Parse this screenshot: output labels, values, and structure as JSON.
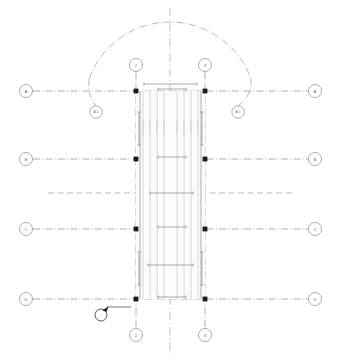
{
  "drawing": {
    "title": "Structural Grid / Stair Shaft Plan",
    "background_color": "#ffffff",
    "line_color": "#8a8a8a",
    "node_color": "#1a1a1a",
    "callout_color": "#1a1a1a",
    "width": 337,
    "height": 362
  },
  "horizontal_grids": [
    {
      "label": "A",
      "y": 91,
      "left_bubble_x": 26,
      "right_bubble_x": 315,
      "line_start_x": 33,
      "line_end_x": 308
    },
    {
      "label": "B",
      "y": 159,
      "left_bubble_x": 26,
      "right_bubble_x": 315,
      "line_start_x": 33,
      "line_end_x": 308
    },
    {
      "label": "C",
      "y": 229,
      "left_bubble_x": 26,
      "right_bubble_x": 315,
      "line_start_x": 33,
      "line_end_x": 308
    },
    {
      "label": "D",
      "y": 299,
      "left_bubble_x": 26,
      "right_bubble_x": 315,
      "line_start_x": 33,
      "line_end_x": 308
    }
  ],
  "vertical_grids": [
    {
      "label": "2",
      "x": 136,
      "top_bubble_y": 65,
      "bottom_bubble_y": 335,
      "line_start_y": 72,
      "line_end_y": 328
    },
    {
      "label": "3",
      "x": 205,
      "top_bubble_y": 65,
      "bottom_bubble_y": 335,
      "line_start_y": 72,
      "line_end_y": 328
    }
  ],
  "radius_bubbles": [
    {
      "label": "A.1",
      "cx": 96,
      "cy": 112
    },
    {
      "label": "A.1",
      "cx": 238,
      "cy": 112
    }
  ],
  "centerline": {
    "name": "building-centerline",
    "x": 170,
    "y_top": 8,
    "y_bottom": 354
  },
  "arc": {
    "name": "radius-arc",
    "cx": 170,
    "cy": 108,
    "radius": 86,
    "start_angle_deg": 200,
    "end_angle_deg": 340
  },
  "secondary_dashed_line": {
    "name": "secondary-axis",
    "y": 193,
    "x_start": 48,
    "x_end": 292
  },
  "shaft": {
    "name": "stair-shaft",
    "x_left": 136,
    "x_right": 205,
    "y_top": 91,
    "y_bottom": 299,
    "inner_lines_x": [
      143,
      150,
      157,
      164,
      177,
      184,
      191,
      198
    ],
    "tread_tick_y_top": 120,
    "tread_tick_y_bottom": 134
  },
  "nodes": [
    {
      "x": 136,
      "y": 91
    },
    {
      "x": 205,
      "y": 91
    },
    {
      "x": 136,
      "y": 159
    },
    {
      "x": 205,
      "y": 159
    },
    {
      "x": 136,
      "y": 229
    },
    {
      "x": 205,
      "y": 229
    },
    {
      "x": 136,
      "y": 299
    },
    {
      "x": 205,
      "y": 299
    }
  ],
  "dimensions": [
    {
      "name": "dim-top-width",
      "orientation": "horizontal",
      "x1": 144,
      "x2": 197,
      "y": 84,
      "text": ""
    },
    {
      "name": "dim-grid-a",
      "orientation": "horizontal",
      "x1": 158,
      "x2": 186,
      "y": 89,
      "text": ""
    },
    {
      "name": "dim-grid-b",
      "orientation": "horizontal",
      "x1": 158,
      "x2": 186,
      "y": 157,
      "text": ""
    },
    {
      "name": "dim-mid-axis",
      "orientation": "horizontal",
      "x1": 150,
      "x2": 193,
      "y": 193,
      "text": ""
    },
    {
      "name": "dim-grid-c",
      "orientation": "horizontal",
      "x1": 158,
      "x2": 186,
      "y": 227,
      "text": ""
    },
    {
      "name": "dim-lower-run",
      "orientation": "horizontal",
      "x1": 148,
      "x2": 193,
      "y": 265,
      "text": ""
    },
    {
      "name": "dim-grid-d",
      "orientation": "horizontal",
      "x1": 158,
      "x2": 186,
      "y": 297,
      "text": ""
    },
    {
      "name": "dim-left-vertical",
      "orientation": "vertical",
      "y1": 112,
      "y2": 145,
      "x": 139,
      "text": ""
    },
    {
      "name": "dim-right-vertical",
      "orientation": "vertical",
      "y1": 112,
      "y2": 145,
      "x": 202,
      "text": ""
    },
    {
      "name": "dim-left-lower",
      "orientation": "vertical",
      "y1": 252,
      "y2": 285,
      "x": 139,
      "text": ""
    },
    {
      "name": "dim-right-lower",
      "orientation": "vertical",
      "y1": 252,
      "y2": 285,
      "x": 202,
      "text": ""
    }
  ],
  "detail_callout": {
    "name": "detail-callout",
    "cx": 101,
    "cy": 315,
    "radius": 6,
    "pointer_x": 106,
    "pointer_y": 308,
    "leader_x_end": 131,
    "leader_y": 307,
    "label": ""
  }
}
